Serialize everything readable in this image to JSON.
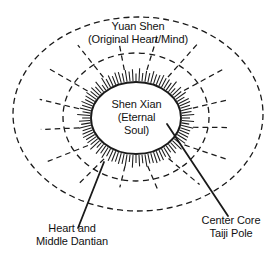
{
  "diagram": {
    "labels": {
      "outer_field": {
        "line1": "Yuan Shen",
        "line2": "(Original Heart/Mind)"
      },
      "core": {
        "line1": "Shen Xian",
        "line2": "(Eternal",
        "line3": "Soul)"
      },
      "lower_left_callout": {
        "line1": "Heart and",
        "line2": "Middle Dantian"
      },
      "lower_right_callout": {
        "line1": "Center Core",
        "line2": "Taiji Pole"
      }
    },
    "colors": {
      "stroke": "#1a1a1a",
      "text": "#111111",
      "background": "#ffffff"
    },
    "geometry": {
      "outer_ellipse": {
        "cx": 138,
        "cy": 114,
        "rx": 125,
        "ry": 97,
        "style": "dashed"
      },
      "middle_ellipse": {
        "cx": 136,
        "cy": 117,
        "rx": 73,
        "ry": 64,
        "style": "dashed"
      },
      "core_ellipse": {
        "cx": 136,
        "cy": 118,
        "rx": 45,
        "ry": 36,
        "style": "solid"
      },
      "radial_dashed_spokes": 16,
      "core_tick_marks": 96
    }
  }
}
